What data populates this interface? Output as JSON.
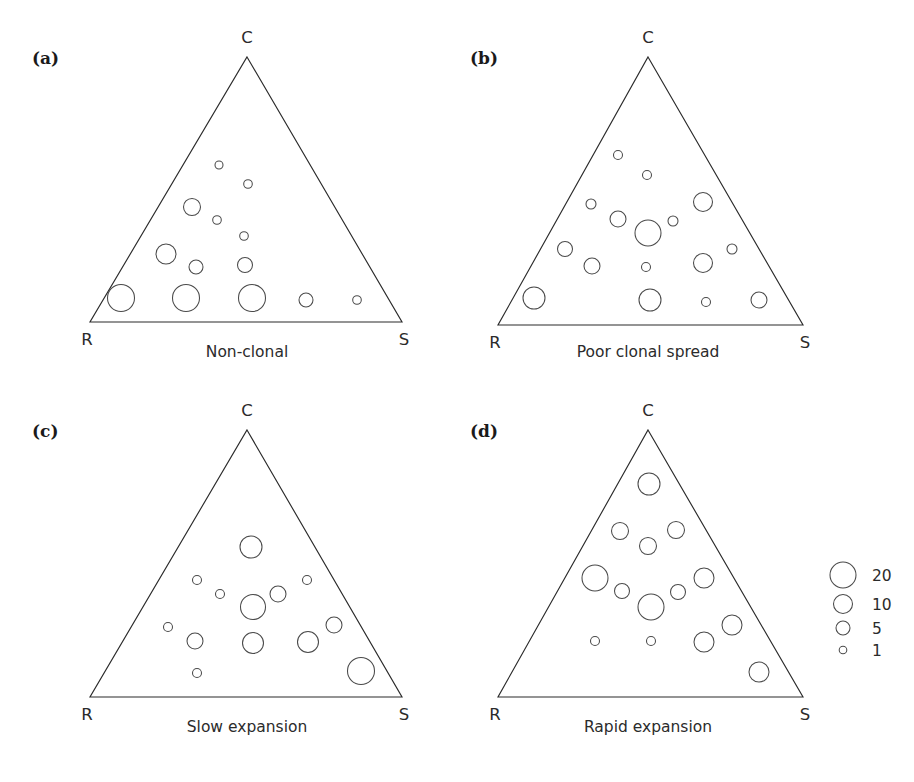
{
  "figure": {
    "type": "multi-panel-ternary-bubble",
    "panel_count": 4,
    "background_color": "#ffffff",
    "line_color": "#2b2b2b",
    "bubble_stroke_color": "#4a4a4a"
  },
  "legend": {
    "name": "bubble-size-legend",
    "title": "",
    "entries": [
      {
        "label": "20",
        "value": 20,
        "radius_px": 13.0,
        "cx": 843,
        "cy": 575
      },
      {
        "label": "10",
        "value": 10,
        "radius_px": 9.5,
        "cx": 843,
        "cy": 604
      },
      {
        "label": "5",
        "value": 5,
        "radius_px": 7.0,
        "cx": 843,
        "cy": 628
      },
      {
        "label": "1",
        "value": 1,
        "radius_px": 3.8,
        "cx": 843,
        "cy": 650
      }
    ],
    "label_x": 872
  },
  "chart_data": {
    "type": "scatter",
    "title": "",
    "subtitle": "",
    "xlabel": "",
    "ylabel": "",
    "axis_vertices": {
      "top": "C",
      "bottom_left": "R",
      "bottom_right": "S"
    },
    "size_legend_values": [
      20,
      10,
      5,
      1
    ],
    "panels": [
      {
        "tag": "(a)",
        "caption": "Non-clonal",
        "vertices": {
          "top": "C",
          "bottom_left": "R",
          "bottom_right": "S"
        },
        "tag_pos": {
          "x": 32,
          "y": 64
        },
        "apex": {
          "x": 247,
          "y": 57
        },
        "base_left": {
          "x": 90,
          "y": 322
        },
        "base_right": {
          "x": 402,
          "y": 322
        },
        "apex_label_pos": {
          "x": 247,
          "y": 43
        },
        "left_label_pos": {
          "x": 87,
          "y": 345
        },
        "right_label_pos": {
          "x": 404,
          "y": 345
        },
        "caption_pos": {
          "x": 247,
          "y": 357
        },
        "points": [
          {
            "cx": 219,
            "cy": 165,
            "r": 4.0,
            "value": 1
          },
          {
            "cx": 248,
            "cy": 184,
            "r": 4.3,
            "value": 1
          },
          {
            "cx": 192,
            "cy": 207,
            "r": 8.5,
            "value": 8
          },
          {
            "cx": 217,
            "cy": 220,
            "r": 4.3,
            "value": 1
          },
          {
            "cx": 244,
            "cy": 236,
            "r": 4.3,
            "value": 1
          },
          {
            "cx": 166,
            "cy": 254,
            "r": 10.0,
            "value": 11
          },
          {
            "cx": 196,
            "cy": 267,
            "r": 7.0,
            "value": 5
          },
          {
            "cx": 245,
            "cy": 265,
            "r": 7.5,
            "value": 6
          },
          {
            "cx": 121,
            "cy": 298,
            "r": 13.5,
            "value": 21
          },
          {
            "cx": 186,
            "cy": 298,
            "r": 13.5,
            "value": 21
          },
          {
            "cx": 252,
            "cy": 298,
            "r": 13.5,
            "value": 21
          },
          {
            "cx": 306,
            "cy": 300,
            "r": 7.0,
            "value": 5
          },
          {
            "cx": 357,
            "cy": 300,
            "r": 4.3,
            "value": 1
          }
        ]
      },
      {
        "tag": "(b)",
        "caption": "Poor clonal spread",
        "vertices": {
          "top": "C",
          "bottom_left": "R",
          "bottom_right": "S"
        },
        "tag_pos": {
          "x": 470,
          "y": 64
        },
        "apex": {
          "x": 648,
          "y": 57
        },
        "base_left": {
          "x": 498,
          "y": 325
        },
        "base_right": {
          "x": 803,
          "y": 325
        },
        "apex_label_pos": {
          "x": 648,
          "y": 43
        },
        "left_label_pos": {
          "x": 495,
          "y": 348
        },
        "right_label_pos": {
          "x": 805,
          "y": 348
        },
        "caption_pos": {
          "x": 648,
          "y": 357
        },
        "points": [
          {
            "cx": 618,
            "cy": 155,
            "r": 4.5,
            "value": 1
          },
          {
            "cx": 647,
            "cy": 175,
            "r": 4.5,
            "value": 1
          },
          {
            "cx": 591,
            "cy": 204,
            "r": 5.0,
            "value": 2
          },
          {
            "cx": 618,
            "cy": 219,
            "r": 8.0,
            "value": 7
          },
          {
            "cx": 648,
            "cy": 233,
            "r": 13.0,
            "value": 20
          },
          {
            "cx": 673,
            "cy": 221,
            "r": 5.0,
            "value": 2
          },
          {
            "cx": 703,
            "cy": 202,
            "r": 9.5,
            "value": 10
          },
          {
            "cx": 565,
            "cy": 249,
            "r": 7.5,
            "value": 6
          },
          {
            "cx": 592,
            "cy": 266,
            "r": 8.0,
            "value": 7
          },
          {
            "cx": 646,
            "cy": 267,
            "r": 4.5,
            "value": 1
          },
          {
            "cx": 703,
            "cy": 263,
            "r": 9.5,
            "value": 10
          },
          {
            "cx": 732,
            "cy": 249,
            "r": 5.0,
            "value": 2
          },
          {
            "cx": 534,
            "cy": 298,
            "r": 11.0,
            "value": 14
          },
          {
            "cx": 650,
            "cy": 300,
            "r": 11.0,
            "value": 14
          },
          {
            "cx": 706,
            "cy": 302,
            "r": 4.5,
            "value": 1
          },
          {
            "cx": 759,
            "cy": 300,
            "r": 8.0,
            "value": 7
          }
        ]
      },
      {
        "tag": "(c)",
        "caption": "Slow expansion",
        "vertices": {
          "top": "C",
          "bottom_left": "R",
          "bottom_right": "S"
        },
        "tag_pos": {
          "x": 32,
          "y": 437
        },
        "apex": {
          "x": 247,
          "y": 430
        },
        "base_left": {
          "x": 90,
          "y": 697
        },
        "base_right": {
          "x": 402,
          "y": 697
        },
        "apex_label_pos": {
          "x": 247,
          "y": 416
        },
        "left_label_pos": {
          "x": 87,
          "y": 720
        },
        "right_label_pos": {
          "x": 404,
          "y": 720
        },
        "caption_pos": {
          "x": 247,
          "y": 732
        },
        "points": [
          {
            "cx": 251,
            "cy": 547,
            "r": 11.0,
            "value": 14
          },
          {
            "cx": 197,
            "cy": 580,
            "r": 4.5,
            "value": 1
          },
          {
            "cx": 220,
            "cy": 594,
            "r": 4.5,
            "value": 1
          },
          {
            "cx": 253,
            "cy": 607,
            "r": 12.5,
            "value": 18
          },
          {
            "cx": 278,
            "cy": 594,
            "r": 8.0,
            "value": 7
          },
          {
            "cx": 307,
            "cy": 580,
            "r": 4.5,
            "value": 1
          },
          {
            "cx": 168,
            "cy": 627,
            "r": 4.5,
            "value": 1
          },
          {
            "cx": 195,
            "cy": 641,
            "r": 8.0,
            "value": 7
          },
          {
            "cx": 253,
            "cy": 643,
            "r": 10.5,
            "value": 13
          },
          {
            "cx": 308,
            "cy": 642,
            "r": 10.5,
            "value": 13
          },
          {
            "cx": 334,
            "cy": 625,
            "r": 8.0,
            "value": 7
          },
          {
            "cx": 197,
            "cy": 673,
            "r": 4.5,
            "value": 1
          },
          {
            "cx": 361,
            "cy": 671,
            "r": 13.5,
            "value": 21
          }
        ]
      },
      {
        "tag": "(d)",
        "caption": "Rapid expansion",
        "vertices": {
          "top": "C",
          "bottom_left": "R",
          "bottom_right": "S"
        },
        "tag_pos": {
          "x": 470,
          "y": 437
        },
        "apex": {
          "x": 648,
          "y": 430
        },
        "base_left": {
          "x": 498,
          "y": 697
        },
        "base_right": {
          "x": 803,
          "y": 697
        },
        "apex_label_pos": {
          "x": 648,
          "y": 416
        },
        "left_label_pos": {
          "x": 495,
          "y": 720
        },
        "right_label_pos": {
          "x": 805,
          "y": 720
        },
        "caption_pos": {
          "x": 648,
          "y": 732
        },
        "points": [
          {
            "cx": 649,
            "cy": 484,
            "r": 11.0,
            "value": 14
          },
          {
            "cx": 620,
            "cy": 531,
            "r": 8.5,
            "value": 8
          },
          {
            "cx": 648,
            "cy": 546,
            "r": 8.5,
            "value": 8
          },
          {
            "cx": 676,
            "cy": 530,
            "r": 8.5,
            "value": 8
          },
          {
            "cx": 595,
            "cy": 578,
            "r": 13.0,
            "value": 20
          },
          {
            "cx": 622,
            "cy": 591,
            "r": 7.5,
            "value": 6
          },
          {
            "cx": 651,
            "cy": 607,
            "r": 13.0,
            "value": 20
          },
          {
            "cx": 678,
            "cy": 592,
            "r": 7.5,
            "value": 6
          },
          {
            "cx": 704,
            "cy": 578,
            "r": 10.0,
            "value": 11
          },
          {
            "cx": 595,
            "cy": 641,
            "r": 4.5,
            "value": 1
          },
          {
            "cx": 651,
            "cy": 641,
            "r": 4.5,
            "value": 1
          },
          {
            "cx": 704,
            "cy": 642,
            "r": 10.0,
            "value": 11
          },
          {
            "cx": 732,
            "cy": 625,
            "r": 10.0,
            "value": 11
          },
          {
            "cx": 759,
            "cy": 672,
            "r": 10.0,
            "value": 11
          }
        ]
      }
    ]
  }
}
